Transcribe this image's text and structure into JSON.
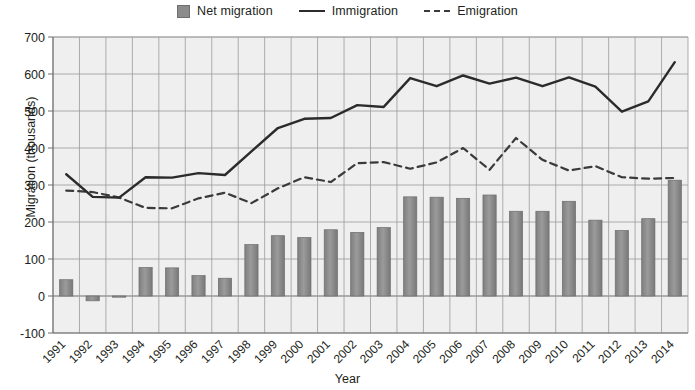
{
  "chart_data": {
    "type": "bar",
    "title": "",
    "xlabel": "Year",
    "ylabel": "Migration (thousands)",
    "ylim": [
      -100,
      700
    ],
    "ytick_step": 100,
    "yticks": [
      -100,
      0,
      100,
      200,
      300,
      400,
      500,
      600,
      700
    ],
    "grid": true,
    "legend_position": "top-center",
    "categories": [
      "1991",
      "1992",
      "1993",
      "1994",
      "1995",
      "1996",
      "1997",
      "1998",
      "1999",
      "2000",
      "2001",
      "2002",
      "2003",
      "2004",
      "2005",
      "2006",
      "2007",
      "2008",
      "2009",
      "2010",
      "2011",
      "2012",
      "2013",
      "2014"
    ],
    "series": [
      {
        "name": "Net migration",
        "type": "bar",
        "color": "#8c8c8c",
        "values": [
          44,
          -13,
          -1,
          77,
          76,
          55,
          48,
          139,
          163,
          158,
          179,
          172,
          185,
          268,
          267,
          264,
          273,
          229,
          229,
          256,
          205,
          177,
          209,
          313
        ]
      },
      {
        "name": "Immigration",
        "type": "line",
        "style": "solid",
        "color": "#2b2b2b",
        "values": [
          329,
          268,
          266,
          321,
          320,
          332,
          327,
          391,
          454,
          479,
          481,
          516,
          511,
          589,
          567,
          596,
          574,
          590,
          567,
          591,
          566,
          498,
          526,
          632
        ]
      },
      {
        "name": "Emigration",
        "type": "line",
        "style": "dashed",
        "color": "#3a3a3a",
        "values": [
          285,
          281,
          266,
          238,
          237,
          264,
          279,
          251,
          291,
          321,
          308,
          359,
          362,
          344,
          361,
          400,
          341,
          427,
          368,
          339,
          351,
          321,
          317,
          319
        ]
      }
    ]
  },
  "legend": {
    "items": [
      {
        "label": "Net migration",
        "marker": "square-swatch-icon"
      },
      {
        "label": "Immigration",
        "marker": "solid-line-icon"
      },
      {
        "label": "Emigration",
        "marker": "dashed-line-icon"
      }
    ]
  },
  "axes": {
    "y_title": "Migration (thousands)",
    "x_title": "Year"
  },
  "colors": {
    "bar_fill": "#8c8c8c",
    "bar_stroke": "#6d6d6d",
    "immigration_line": "#2b2b2b",
    "emigration_line": "#3a3a3a",
    "plot_background": "#efefef",
    "gridline": "#9a9a9a"
  }
}
